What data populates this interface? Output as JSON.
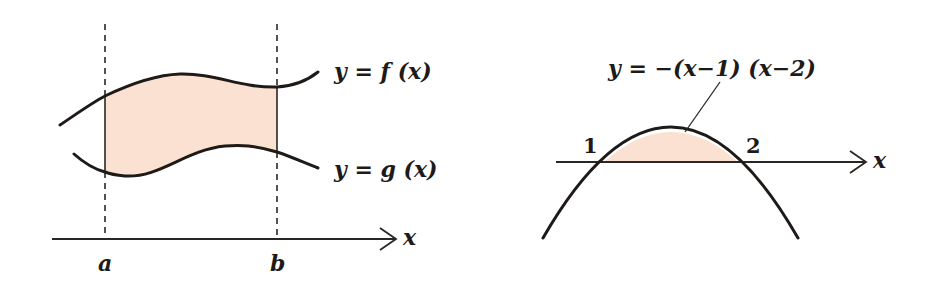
{
  "colors": {
    "background": "#ffffff",
    "ink": "#1e1a18",
    "shaded_region": "#fbe1d2"
  },
  "figure_left": {
    "description": "Area between two curves y=f(x) and y=g(x) over [a, b]",
    "labels": {
      "f_curve": "y = f (x)",
      "g_curve": "y = g (x)",
      "x_axis": "x",
      "bound_left": "a",
      "bound_right": "b"
    },
    "shaded": true,
    "boundaries": "dashed vertical lines at x=a and x=b"
  },
  "figure_right": {
    "description": "Area between parabola and x-axis from 1 to 2",
    "labels": {
      "curve": "y = −(x−1) (x−2)",
      "x_axis": "x",
      "root_1": "1",
      "root_2": "2"
    },
    "shaded": true
  }
}
